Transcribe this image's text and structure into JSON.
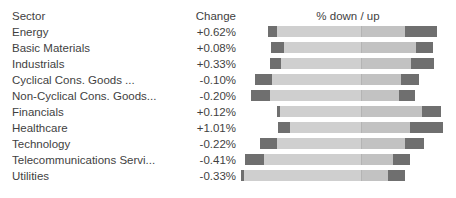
{
  "header": {
    "sector_label": "Sector",
    "change_label": "Change",
    "bar_caption": "% down / up"
  },
  "colors": {
    "text": "#3f3f3f",
    "bar_track": "#cfcfcf",
    "bar_track_alt": "#c2c2c2",
    "bar_segment": "#6f6f6f",
    "midline": "#b4b4b4",
    "background": "#ffffff"
  },
  "chart_data": {
    "type": "bar",
    "title": "",
    "xlabel": "% down / up",
    "ylabel": "Sector",
    "columns": [
      "Sector",
      "Change",
      "% down / up"
    ],
    "categories": [
      "Energy",
      "Basic Materials",
      "Industrials",
      "Cyclical Cons. Goods ...",
      "Non-Cyclical Cons. Goods...",
      "Financials",
      "Healthcare",
      "Technology",
      "Telecommunications Servi...",
      "Utilities"
    ],
    "values": [
      0.62,
      0.08,
      0.33,
      -0.1,
      -0.2,
      0.12,
      1.01,
      -0.22,
      -0.41,
      -0.33
    ],
    "value_labels": [
      "+0.62%",
      "+0.08%",
      "+0.33%",
      "-0.10%",
      "-0.20%",
      "+0.12%",
      "+1.01%",
      "-0.22%",
      "-0.41%",
      "-0.33%"
    ]
  },
  "rows": [
    {
      "sector": "Energy",
      "change": "+0.62%",
      "bar": {
        "left": 28,
        "width": 169,
        "down_width": 9,
        "up_width": 32,
        "mid": 93
      }
    },
    {
      "sector": "Basic Materials",
      "change": "+0.08%",
      "bar": {
        "left": 31,
        "width": 162,
        "down_width": 13,
        "up_width": 17,
        "mid": 90
      }
    },
    {
      "sector": "Industrials",
      "change": "+0.33%",
      "bar": {
        "left": 30,
        "width": 164,
        "down_width": 11,
        "up_width": 23,
        "mid": 91
      }
    },
    {
      "sector": "Cyclical Cons. Goods ...",
      "change": "-0.10%",
      "bar": {
        "left": 15,
        "width": 164,
        "down_width": 17,
        "up_width": 18,
        "mid": 106
      }
    },
    {
      "sector": "Non-Cyclical Cons. Goods...",
      "change": "-0.20%",
      "bar": {
        "left": 11,
        "width": 164,
        "down_width": 19,
        "up_width": 16,
        "mid": 110
      }
    },
    {
      "sector": "Financials",
      "change": "+0.12%",
      "bar": {
        "left": 37,
        "width": 164,
        "down_width": 3,
        "up_width": 19,
        "mid": 84
      }
    },
    {
      "sector": "Healthcare",
      "change": "+1.01%",
      "bar": {
        "left": 38,
        "width": 165,
        "down_width": 12,
        "up_width": 33,
        "mid": 83
      }
    },
    {
      "sector": "Technology",
      "change": "-0.22%",
      "bar": {
        "left": 20,
        "width": 164,
        "down_width": 17,
        "up_width": 19,
        "mid": 101
      }
    },
    {
      "sector": "Telecommunications Servi...",
      "change": "-0.41%",
      "bar": {
        "left": 5,
        "width": 165,
        "down_width": 19,
        "up_width": 17,
        "mid": 116
      }
    },
    {
      "sector": "Utilities",
      "change": "-0.33%",
      "bar": {
        "left": 1,
        "width": 164,
        "down_width": 3,
        "up_width": 17,
        "mid": 120
      }
    }
  ]
}
